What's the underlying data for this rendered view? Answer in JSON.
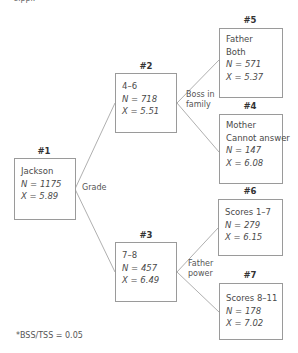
{
  "top_clip_text": "sippi.",
  "nodes": {
    "n1": {
      "id_label": "#1",
      "lines": [
        "Jackson"
      ],
      "n_label": "N = 1175",
      "x_label": "X = 5.89"
    },
    "n2": {
      "id_label": "#2",
      "lines": [
        "4–6"
      ],
      "n_label": "N = 718",
      "x_label": "X = 5.51"
    },
    "n3": {
      "id_label": "#3",
      "lines": [
        "7–8"
      ],
      "n_label": "N = 457",
      "x_label": "X = 6.49"
    },
    "n4": {
      "id_label": "#4",
      "lines": [
        "Mother",
        "Cannot answer"
      ],
      "n_label": "N = 147",
      "x_label": "X = 6.08"
    },
    "n5": {
      "id_label": "#5",
      "lines": [
        "Father",
        "Both"
      ],
      "n_label": "N = 571",
      "x_label": "X = 5.37"
    },
    "n6": {
      "id_label": "#6",
      "lines": [
        "Scores 1–7"
      ],
      "n_label": "N = 279",
      "x_label": "X = 6.15"
    },
    "n7": {
      "id_label": "#7",
      "lines": [
        "Scores 8–11"
      ],
      "n_label": "N = 178",
      "x_label": "X = 7.02"
    }
  },
  "split_labels": {
    "grade": "Grade",
    "boss_line1": "Boss in",
    "boss_line2": "family",
    "father_line1": "Father",
    "father_line2": "power"
  },
  "footnote": "*BSS/TSS = 0.05",
  "colors": {
    "border": "#9a9a9a",
    "edge": "#b0b0b0",
    "text": "#4a4a4a"
  }
}
